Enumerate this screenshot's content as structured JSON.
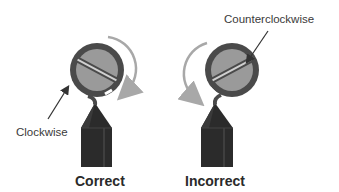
{
  "panels": [
    {
      "caption": "Correct",
      "annotation": "Clockwise",
      "rotation_direction": "clockwise"
    },
    {
      "caption": "Incorrect",
      "annotation": "Counterclockwise",
      "rotation_direction": "counterclockwise"
    }
  ],
  "colors": {
    "screw_head": "#9a9a9a",
    "screw_rim": "#4a4a4a",
    "wire_body": "#2b2b2b",
    "rotation_arrow": "#a8a8a8",
    "pointer_arrow": "#333333",
    "text": "#3a3a3a"
  }
}
